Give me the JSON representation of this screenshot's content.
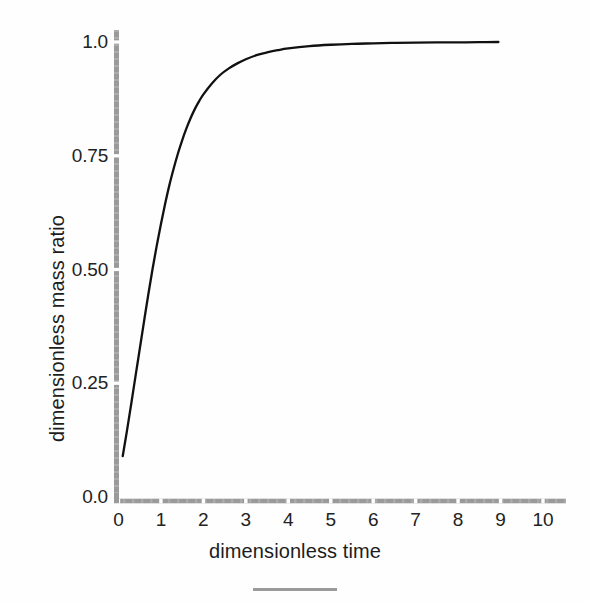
{
  "chart_data": {
    "type": "line",
    "title": "",
    "xlabel": "dimensionless time",
    "ylabel": "dimensionless mass ratio",
    "xlim": [
      0,
      10.3
    ],
    "ylim": [
      0.0,
      1.02
    ],
    "grid": false,
    "legend": null,
    "xticks": [
      "0",
      "1",
      "2",
      "3",
      "4",
      "5",
      "6",
      "7",
      "8",
      "9",
      "10"
    ],
    "xtick_values": [
      0,
      1,
      2,
      3,
      4,
      5,
      6,
      7,
      8,
      9,
      10
    ],
    "yticks": [
      "0.0",
      "0.25",
      "0.50",
      "0.75",
      "1.0"
    ],
    "ytick_values": [
      0.0,
      0.25,
      0.5,
      0.75,
      1.0
    ],
    "series": [
      {
        "name": "dimensionless mass ratio",
        "color": "#111111",
        "x": [
          0.1,
          0.2,
          0.3,
          0.4,
          0.5,
          0.6,
          0.7,
          0.8,
          0.9,
          1.0,
          1.1,
          1.2,
          1.3,
          1.4,
          1.5,
          1.6,
          1.7,
          1.8,
          1.9,
          2.0,
          2.2,
          2.4,
          2.6,
          2.8,
          3.0,
          3.25,
          3.5,
          3.75,
          4.0,
          4.5,
          5.0,
          5.5,
          6.0,
          6.5,
          7.0,
          7.5,
          8.0,
          8.5,
          8.95
        ],
        "y": [
          0.09,
          0.146,
          0.205,
          0.265,
          0.325,
          0.385,
          0.444,
          0.5,
          0.552,
          0.6,
          0.645,
          0.686,
          0.722,
          0.755,
          0.784,
          0.81,
          0.833,
          0.853,
          0.87,
          0.885,
          0.909,
          0.928,
          0.942,
          0.953,
          0.962,
          0.971,
          0.977,
          0.982,
          0.986,
          0.991,
          0.994,
          0.996,
          0.997,
          0.998,
          0.9985,
          0.999,
          0.9993,
          0.9996,
          1.0
        ]
      }
    ]
  },
  "axes": {
    "y_axis_name": "y-axis-line",
    "x_axis_name": "x-axis-line",
    "axis_color": "#9a9a9a"
  },
  "footer": {
    "rule_color": "#9a9a9a"
  }
}
